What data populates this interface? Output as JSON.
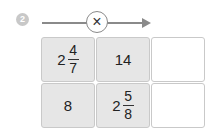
{
  "problem": {
    "number": "2",
    "operator": "×",
    "operator_icon": "multiply-icon"
  },
  "grid": {
    "rows": [
      {
        "cells": [
          {
            "type": "mixed",
            "whole": "2",
            "numerator": "4",
            "denominator": "7"
          },
          {
            "type": "integer",
            "value": "14"
          },
          {
            "type": "empty",
            "value": ""
          }
        ]
      },
      {
        "cells": [
          {
            "type": "integer",
            "value": "8"
          },
          {
            "type": "mixed",
            "whole": "2",
            "numerator": "5",
            "denominator": "8"
          },
          {
            "type": "empty",
            "value": ""
          }
        ]
      }
    ]
  },
  "colors": {
    "filled_cell": "#e6e6e6",
    "border": "#c9c9c9",
    "arrow": "#8a8a8a",
    "badge": "#c8c8c8"
  }
}
